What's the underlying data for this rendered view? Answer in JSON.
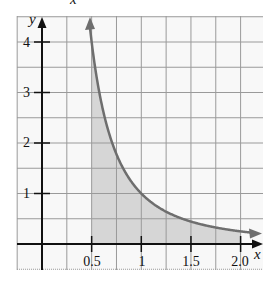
{
  "header": {
    "partial_title_glyph": "x"
  },
  "chart_data": {
    "type": "area",
    "title": "",
    "function": "y = 1/x^2",
    "xlabel": "x",
    "ylabel": "y",
    "x_ticks": [
      0.5,
      1,
      1.5,
      2.0
    ],
    "x_tick_labels": [
      "0.5",
      "1",
      "1.5",
      "2.0"
    ],
    "y_ticks": [
      1,
      2,
      3,
      4
    ],
    "y_tick_labels": [
      "1",
      "2",
      "3",
      "4"
    ],
    "xlim": [
      -0.25,
      2.2
    ],
    "ylim": [
      -0.5,
      4.5
    ],
    "grid": true,
    "grid_step_x": 0.25,
    "grid_step_y": 0.5,
    "shaded_region": {
      "x_from": 0.5,
      "x_to": 2.0,
      "below_curve": true
    },
    "curve_points": [
      {
        "x": 0.47,
        "y": 4.5
      },
      {
        "x": 0.5,
        "y": 4.0
      },
      {
        "x": 0.75,
        "y": 1.78
      },
      {
        "x": 1.0,
        "y": 1.0
      },
      {
        "x": 1.25,
        "y": 0.64
      },
      {
        "x": 1.5,
        "y": 0.44
      },
      {
        "x": 1.75,
        "y": 0.33
      },
      {
        "x": 2.0,
        "y": 0.25
      },
      {
        "x": 2.2,
        "y": 0.21
      }
    ],
    "colors": {
      "curve": "#6e6e6e",
      "shade": "#d6d6d6",
      "grid": "#9a9a9a",
      "axis": "#111111"
    }
  }
}
